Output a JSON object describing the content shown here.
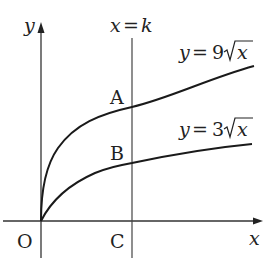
{
  "diagram": {
    "type": "function-graph",
    "axes": {
      "x_label": "x",
      "y_label": "y",
      "origin_label": "O"
    },
    "vertical_line": {
      "label_var": "x",
      "label_eq": "=",
      "label_val": "k"
    },
    "curves": [
      {
        "name": "upper",
        "label_lhs": "y",
        "label_eq": "=",
        "label_coef": "9",
        "label_rad": "x"
      },
      {
        "name": "lower",
        "label_lhs": "y",
        "label_eq": "=",
        "label_coef": "3",
        "label_rad": "x"
      }
    ],
    "points": {
      "A": "A",
      "B": "B",
      "C": "C"
    },
    "colors": {
      "stroke": "#1a1a1a",
      "axis": "#333333",
      "text": "#222222"
    }
  }
}
